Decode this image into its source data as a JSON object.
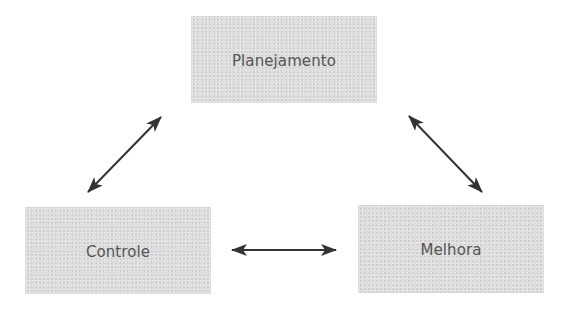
{
  "diagram": {
    "type": "cycle",
    "nodes": [
      {
        "id": "planejamento",
        "label": "Planejamento",
        "position": "top"
      },
      {
        "id": "controle",
        "label": "Controle",
        "position": "bottom-left"
      },
      {
        "id": "melhora",
        "label": "Melhora",
        "position": "bottom-right"
      }
    ],
    "edges": [
      {
        "from": "planejamento",
        "to": "controle",
        "direction": "bidirectional"
      },
      {
        "from": "controle",
        "to": "melhora",
        "direction": "bidirectional"
      },
      {
        "from": "melhora",
        "to": "planejamento",
        "direction": "bidirectional"
      }
    ],
    "colors": {
      "node_fill": "#dedede",
      "text": "#555555",
      "arrow": "#333333"
    }
  }
}
